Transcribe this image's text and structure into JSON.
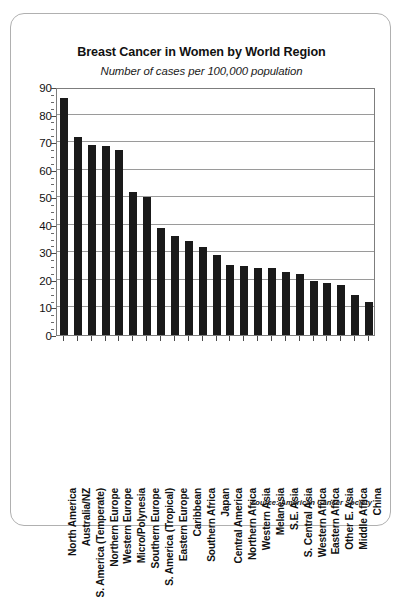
{
  "chart_data": {
    "type": "bar",
    "title": "Breast Cancer in Women by World Region",
    "subtitle": "Number of cases per 100,000 population",
    "xlabel": "",
    "ylabel": "",
    "ylim": [
      0,
      90
    ],
    "ytick_step": 10,
    "yminor_step": 2.5,
    "grid": true,
    "legend": "none",
    "source": "source: American Cancer Society",
    "bar_color": "#1a1a1a",
    "categories": [
      "North America",
      "Australia/NZ",
      "S. America (Temperate)",
      "Northern Europe",
      "Western Europe",
      "Micro/Polynesia",
      "Southern Europe",
      "S. America (Tropical)",
      "Eastern Europe",
      "Caribbean",
      "Southern Africa",
      "Japan",
      "Central America",
      "Northern Africa",
      "Western Asia",
      "Melanesia",
      "S.E. Asia",
      "S. Central Asia",
      "Western Africa",
      "Eastern Africa",
      "Other E. Asia",
      "Middle Africa",
      "China"
    ],
    "values": [
      86,
      72,
      69,
      68.5,
      67,
      52,
      50,
      39,
      36,
      34,
      32,
      29,
      25.5,
      25,
      24.5,
      24.5,
      23,
      22,
      19.5,
      19,
      18,
      14.5,
      12
    ],
    "ytick_labels": [
      "0",
      "10",
      "20",
      "30",
      "40",
      "50",
      "60",
      "70",
      "80",
      "90"
    ]
  }
}
